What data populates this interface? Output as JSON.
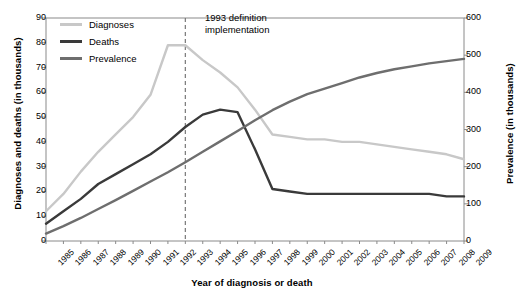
{
  "chart_data": {
    "type": "line",
    "title": "",
    "xlabel": "Year of diagnosis or death",
    "ylabel": "Diagnoses and deaths (in thousands)",
    "ylabel_right": "Prevalence (in thousands)",
    "x": [
      1985,
      1986,
      1987,
      1988,
      1989,
      1990,
      1991,
      1992,
      1993,
      1994,
      1995,
      1996,
      1997,
      1998,
      1999,
      2000,
      2001,
      2002,
      2003,
      2004,
      2005,
      2006,
      2007,
      2008,
      2009
    ],
    "categories": [
      "1985",
      "1986",
      "1987",
      "1988",
      "1989",
      "1990",
      "1991",
      "1992",
      "1993",
      "1994",
      "1995",
      "1996",
      "1997",
      "1998",
      "1999",
      "2000",
      "2001",
      "2002",
      "2003",
      "2004",
      "2005",
      "2006",
      "2007",
      "2008",
      "2009"
    ],
    "ylim": [
      0,
      90
    ],
    "yticks": [
      0,
      10,
      20,
      30,
      40,
      50,
      60,
      70,
      80,
      90
    ],
    "ylim_right": [
      0,
      600
    ],
    "yticks_right": [
      0,
      100,
      200,
      300,
      400,
      500,
      600
    ],
    "grid": false,
    "legend_position": "top-left",
    "series": [
      {
        "name": "Diagnoses",
        "axis": "left",
        "color": "#c8c8c8",
        "width": 2.4,
        "values": [
          12,
          19,
          28,
          36,
          43,
          50,
          59,
          79,
          79,
          73,
          68,
          62,
          53,
          43,
          42,
          41,
          41,
          40,
          40,
          39,
          38,
          37,
          36,
          35,
          33
        ]
      },
      {
        "name": "Deaths",
        "axis": "left",
        "color": "#3a3a3a",
        "width": 2.4,
        "values": [
          7,
          12,
          17,
          23,
          27,
          31,
          35,
          40,
          46,
          51,
          53,
          52,
          37,
          21,
          20,
          19,
          19,
          19,
          19,
          19,
          19,
          19,
          19,
          18,
          18
        ]
      },
      {
        "name": "Prevalence",
        "axis": "right",
        "color": "#6e6e6e",
        "width": 2.4,
        "values": [
          20,
          40,
          62,
          86,
          110,
          135,
          160,
          185,
          212,
          240,
          268,
          296,
          325,
          352,
          375,
          395,
          410,
          425,
          440,
          452,
          462,
          470,
          478,
          484,
          490
        ]
      }
    ],
    "annotations": [
      {
        "name": "1993-definition-marker",
        "x": 1993,
        "line_style": "dashed",
        "color": "#777777",
        "text_line1": "1993 definition",
        "text_line2": "implementation"
      }
    ]
  },
  "legend": {
    "items": [
      {
        "label": "Diagnoses",
        "color": "#c8c8c8"
      },
      {
        "label": "Deaths",
        "color": "#3a3a3a"
      },
      {
        "label": "Prevalence",
        "color": "#6e6e6e"
      }
    ]
  },
  "annotation": {
    "line1": "1993 definition",
    "line2": "implementation"
  },
  "axes": {
    "left_title": "Diagnoses and deaths (in thousands)",
    "right_title": "Prevalence (in thousands)",
    "bottom_title": "Year of diagnosis or death"
  }
}
